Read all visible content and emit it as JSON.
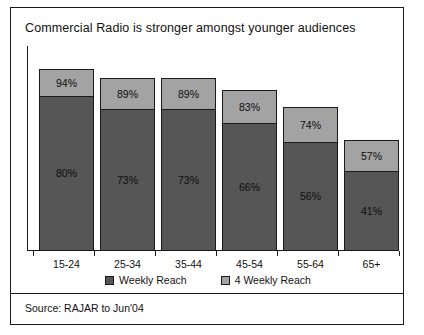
{
  "slide": {
    "title": "Commercial Radio is stronger amongst younger audiences",
    "source": "Source: RAJAR to Jun'04"
  },
  "legend": {
    "items": [
      {
        "label": "Weekly Reach",
        "color": "#565656",
        "swatch": "dark-swatch-icon"
      },
      {
        "label": "4 Weekly Reach",
        "color": "#a3a3a3",
        "swatch": "light-swatch-icon"
      }
    ]
  },
  "chart_data": {
    "type": "bar",
    "subtype": "stacked",
    "title": "Commercial Radio is stronger amongst younger audiences",
    "xlabel": "",
    "ylabel": "",
    "ylim": [
      0,
      100
    ],
    "grid": false,
    "legend_position": "bottom-center",
    "categories": [
      "15-24",
      "25-34",
      "35-44",
      "45-54",
      "55-64",
      "65+"
    ],
    "series": [
      {
        "name": "Weekly Reach",
        "color": "#565656",
        "values": [
          80,
          73,
          73,
          66,
          56,
          41
        ],
        "labels": [
          "80%",
          "73%",
          "73%",
          "66%",
          "56%",
          "41%"
        ]
      },
      {
        "name": "4 Weekly Reach",
        "color": "#a3a3a3",
        "values": [
          94,
          89,
          89,
          83,
          74,
          57
        ],
        "labels": [
          "94%",
          "89%",
          "89%",
          "83%",
          "74%",
          "57%"
        ]
      }
    ]
  }
}
